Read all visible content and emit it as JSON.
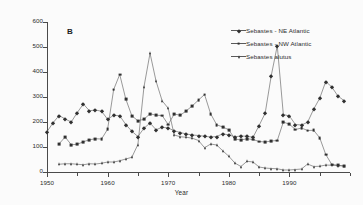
{
  "panel": {
    "label": "B"
  },
  "axes": {
    "ylabel": "Landings ('000s tonnes)",
    "xlabel": "Year",
    "yticks": [
      0,
      100,
      200,
      300,
      400,
      500,
      600
    ],
    "xticks": [
      1950,
      1960,
      1970,
      1980,
      1990
    ],
    "xminor": [
      1955,
      1965,
      1975,
      1985,
      1995,
      2000
    ]
  },
  "chart_data": {
    "type": "line",
    "title": "",
    "subtitle": "",
    "xlabel": "Year",
    "ylabel": "Landings ('000s tonnes)",
    "xlim": [
      1950,
      2000
    ],
    "ylim": [
      0,
      600
    ],
    "grid": false,
    "legend_position": "top-right",
    "annotations": [
      {
        "text": "B",
        "role": "panel-label",
        "x": 1953,
        "y": 540
      }
    ],
    "series": [
      {
        "name": "Sebastes - NE Atlantic",
        "marker": "diamond",
        "color": "#303030",
        "x": [
          1950,
          1951,
          1952,
          1953,
          1954,
          1955,
          1956,
          1957,
          1958,
          1959,
          1960,
          1961,
          1962,
          1963,
          1964,
          1965,
          1966,
          1967,
          1968,
          1969,
          1970,
          1971,
          1972,
          1973,
          1974,
          1975,
          1976,
          1977,
          1978,
          1979,
          1980,
          1981,
          1982,
          1983,
          1984,
          1985,
          1986,
          1987,
          1988,
          1989,
          1990,
          1991,
          1992,
          1993,
          1994,
          1995,
          1996,
          1997,
          1998,
          1999
        ],
        "values": [
          161,
          197,
          226,
          212,
          200,
          238,
          272,
          245,
          248,
          243,
          211,
          227,
          225,
          190,
          163,
          142,
          175,
          196,
          169,
          179,
          176,
          165,
          158,
          152,
          148,
          146,
          143,
          140,
          142,
          153,
          148,
          141,
          144,
          143,
          139,
          186,
          235,
          385,
          505,
          230,
          224,
          190,
          188,
          199,
          251,
          295,
          362,
          340,
          304,
          286
        ]
      },
      {
        "name": "Sebastes - NW Atlantic",
        "marker": "square",
        "color": "#303030",
        "x": [
          1952,
          1953,
          1954,
          1955,
          1956,
          1957,
          1958,
          1959,
          1960,
          1961,
          1962,
          1963,
          1964,
          1965,
          1966,
          1967,
          1968,
          1969,
          1970,
          1971,
          1972,
          1973,
          1974,
          1975,
          1976,
          1977,
          1978,
          1979,
          1980,
          1981,
          1982,
          1983,
          1984,
          1985,
          1986,
          1987,
          1988,
          1989,
          1990,
          1991,
          1992,
          1993,
          1994,
          1995,
          1996,
          1997,
          1998,
          1999
        ],
        "values": [
          113,
          140,
          109,
          111,
          121,
          129,
          133,
          132,
          171,
          330,
          390,
          292,
          225,
          205,
          211,
          233,
          227,
          226,
          190,
          232,
          227,
          245,
          265,
          288,
          310,
          233,
          189,
          180,
          169,
          132,
          128,
          133,
          130,
          122,
          120,
          124,
          126,
          200,
          191,
          170,
          176,
          166,
          167,
          137,
          70,
          30,
          27,
          24
        ]
      },
      {
        "name": "Sebastes alutus",
        "marker": "triangle",
        "color": "#303030",
        "x": [
          1952,
          1953,
          1954,
          1955,
          1956,
          1957,
          1958,
          1959,
          1960,
          1961,
          1962,
          1963,
          1964,
          1965,
          1966,
          1967,
          1968,
          1969,
          1970,
          1971,
          1972,
          1973,
          1974,
          1975,
          1976,
          1977,
          1978,
          1979,
          1980,
          1981,
          1982,
          1983,
          1984,
          1985,
          1986,
          1987,
          1988,
          1989,
          1990,
          1991,
          1992,
          1993,
          1994,
          1995,
          1996,
          1997,
          1998,
          1999
        ],
        "values": [
          31,
          33,
          33,
          31,
          29,
          33,
          32,
          35,
          40,
          40,
          45,
          52,
          59,
          110,
          340,
          475,
          363,
          285,
          255,
          148,
          141,
          139,
          135,
          126,
          97,
          112,
          108,
          85,
          63,
          36,
          22,
          43,
          40,
          20,
          16,
          14,
          13,
          8,
          8,
          10,
          12,
          32,
          22,
          23,
          28,
          27,
          26,
          24
        ]
      }
    ]
  },
  "legend": {
    "items": [
      {
        "label": "Sebastes - NE Atlantic",
        "marker": "diamond"
      },
      {
        "label": "Sebastes - NW Atlantic",
        "marker": "square"
      },
      {
        "label": "Sebastes alutus",
        "marker": "triangle"
      }
    ]
  }
}
